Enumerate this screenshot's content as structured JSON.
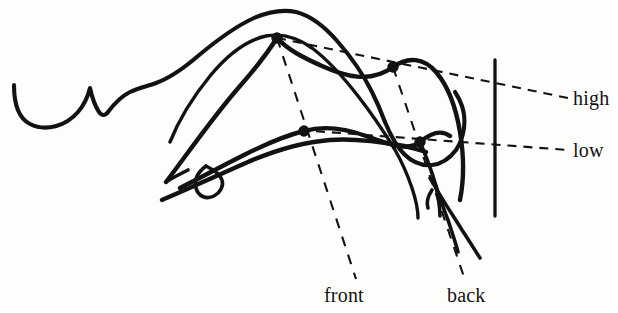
{
  "figure": {
    "type": "sagittal-vocal-tract-diagram",
    "background_color": "#fdfdfc",
    "ink_color": "#141210"
  },
  "labels": {
    "high": "high",
    "low": "low",
    "front": "front",
    "back": "back"
  },
  "dimension_lines": [
    {
      "name": "high-line",
      "label": "high",
      "style": "dashed",
      "from": [
        277,
        38
      ],
      "to": [
        568,
        98
      ]
    },
    {
      "name": "low-line",
      "label": "low",
      "style": "dashed",
      "from": [
        300,
        130
      ],
      "to": [
        568,
        150
      ]
    },
    {
      "name": "front-line",
      "label": "front",
      "style": "dashed",
      "from": [
        277,
        38
      ],
      "to": [
        356,
        279
      ]
    },
    {
      "name": "back-line",
      "label": "back",
      "style": "dashed",
      "from": [
        393,
        67
      ],
      "to": [
        464,
        277
      ]
    }
  ],
  "vertices": [
    {
      "name": "high-front",
      "x": 277,
      "y": 38,
      "radius": 5.2
    },
    {
      "name": "high-back",
      "x": 393,
      "y": 67,
      "radius": 5.2
    },
    {
      "name": "low-front",
      "x": 304,
      "y": 131,
      "radius": 5.2
    },
    {
      "name": "low-back",
      "x": 420,
      "y": 142,
      "radius": 5.2
    }
  ],
  "strokes": {
    "upper_outline": "M 14,85 C 14,104 18,118 30,124 C 46,132 66,126 78,112 C 85,104 88,96 90,88 C 92,97 95,106 99,112 C 102,116 105,116 108,112 C 114,104 122,96 130,92 C 139,88 148,86 156,83 C 170,78 184,68 198,56 C 216,41 236,26 254,18 C 268,12 282,9 296,12 C 312,16 326,28 338,42 C 352,58 364,76 372,92 C 378,104 382,114 385,122",
    "upper_outline_tail": "M 385,122 C 390,134 396,146 404,154 C 412,162 422,166 432,165 C 442,164 450,158 456,150 C 460,144 463,136 464,128 C 465,120 464,112 462,106 C 460,100 457,95 455,92",
    "palate_curve": "M 170,142 C 178,122 192,98 210,76 C 228,54 248,40 266,36 C 282,33 298,38 312,48 C 328,60 344,78 358,96 C 372,114 384,132 394,148",
    "palate_tail": "M 394,148 C 402,162 408,176 412,188 C 416,200 418,210 418,218",
    "tongue_high": "M 166,182 C 186,156 212,118 240,86 C 256,68 268,52 277,38 C 288,50 304,58 322,66 C 344,76 370,84 393,67 C 408,56 424,58 436,72 C 448,86 456,108 460,132 C 464,156 464,180 460,200",
    "tongue_high_front_tip": "M 166,182 C 172,178 180,174 188,170",
    "tongue_mid": "M 180,188 C 200,178 222,166 246,154 C 268,143 288,135 304,131 C 322,126 344,128 366,136 C 388,144 408,152 420,142 C 432,132 442,130 450,136",
    "tongue_low": "M 162,200 C 186,190 216,176 248,162 C 276,150 304,142 330,140 C 356,138 382,142 404,146 C 414,148 420,150 426,152",
    "tongue_tip_loop": "M 206,166 C 198,172 194,180 196,188 C 198,196 206,200 214,196 C 220,193 224,186 222,180 C 220,174 214,170 206,166",
    "tongue_root_a": "M 420,142 C 426,156 432,172 436,186 C 438,196 440,206 440,216",
    "tongue_root_b": "M 436,186 C 440,198 444,210 448,220 C 452,232 456,244 458,252",
    "tongue_root_c": "M 430,178 C 440,196 452,214 462,230 C 470,242 476,252 480,258",
    "pharynx_back_wall": "M 495,60 L 495,216",
    "epiglottis": "M 432,190 C 428,196 426,202 428,208"
  }
}
